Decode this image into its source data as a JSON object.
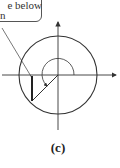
{
  "callout": {
    "line1": "e below",
    "line2": "n"
  },
  "figure": {
    "caption": "(c)",
    "circle": {
      "cx": 58,
      "cy": 75,
      "r": 39
    },
    "angle_degrees_approx": 225,
    "stroke_color": "#333333"
  }
}
